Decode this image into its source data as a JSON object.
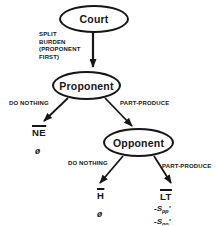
{
  "diagram": {
    "colors": {
      "ink": "#161616",
      "background": "#ffffff"
    },
    "nodes": {
      "court": {
        "label": "Court"
      },
      "proponent": {
        "label": "Proponent"
      },
      "opponent": {
        "label": "Opponent"
      }
    },
    "edges": {
      "court_to_proponent": {
        "label_lines": [
          "SPLIT",
          "BURDEN",
          "(PROPONENT",
          "FIRST)"
        ]
      },
      "proponent_do_nothing": {
        "label": "DO NOTHING"
      },
      "proponent_part_produce": {
        "label": "PART-PRODUCE"
      },
      "opponent_do_nothing": {
        "label": "DO NOTHING"
      },
      "opponent_part_produce": {
        "label": "PART-PRODUCE"
      }
    },
    "leaves": {
      "ne": {
        "label": "NE",
        "payoff": "ø"
      },
      "h": {
        "label": "H",
        "payoff": "ø"
      },
      "lt": {
        "label": "LT",
        "payoff1_base": "-S",
        "payoff1_sub": "pp",
        "payoff1_prime": "′",
        "payoff2_base": "-S",
        "payoff2_sub": "oo",
        "payoff2_prime": "′"
      }
    }
  }
}
